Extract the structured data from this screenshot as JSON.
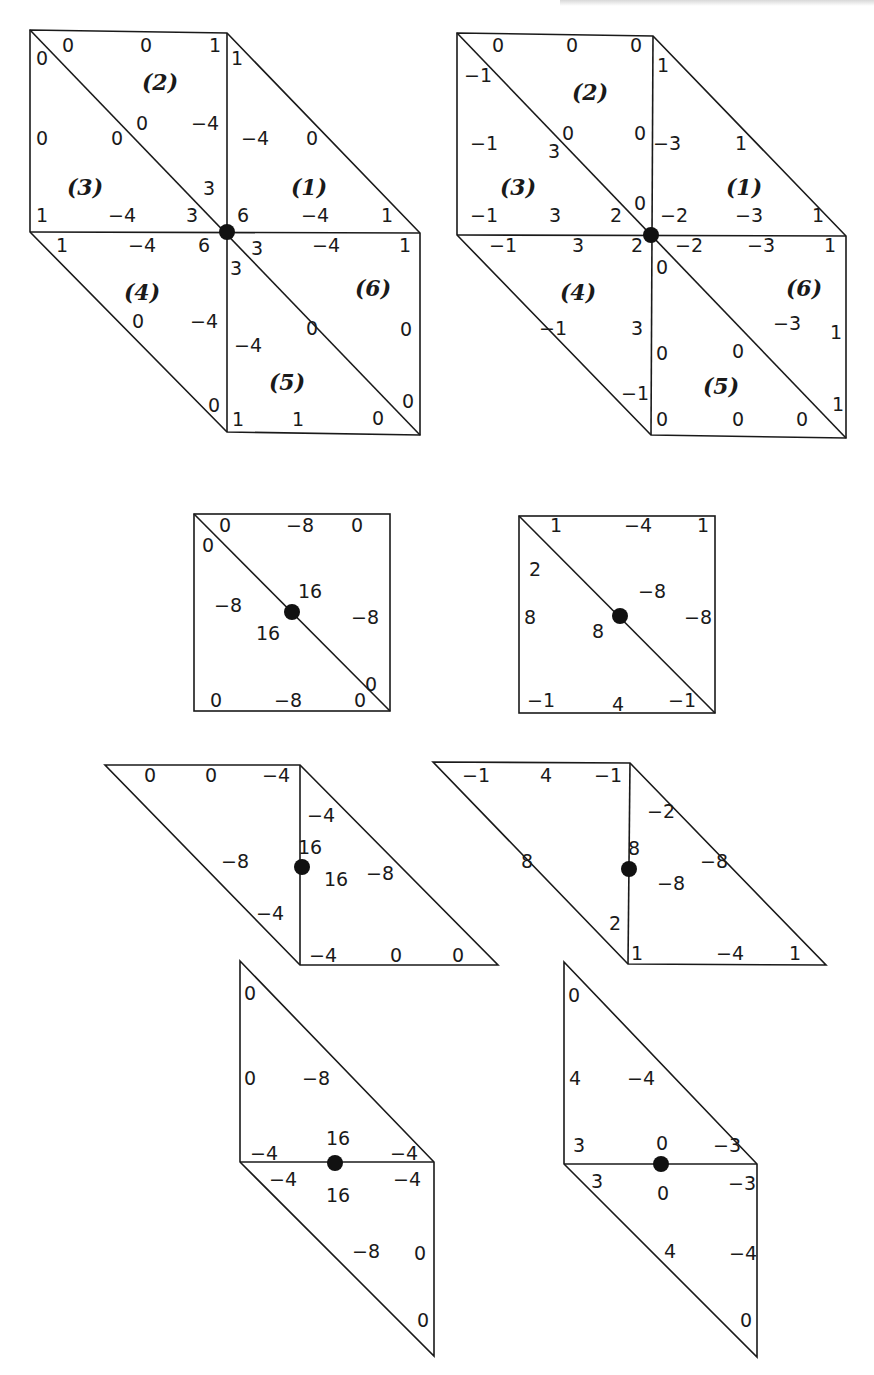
{
  "figure": {
    "panels": [
      {
        "id": "hex-left",
        "shape": "hexagon",
        "center_node": true,
        "regions": [
          "(1)",
          "(2)",
          "(3)",
          "(4)",
          "(5)",
          "(6)"
        ],
        "labels": [
          "0",
          "0",
          "1",
          "0",
          "1",
          "0",
          "0",
          "0",
          "-4",
          "-4",
          "0",
          "3",
          "1",
          "-4",
          "3",
          "6",
          "-4",
          "1",
          "1",
          "-4",
          "6",
          "3",
          "-4",
          "1",
          "3",
          "0",
          "-4",
          "-4",
          "0",
          "0",
          "0",
          "1",
          "1",
          "0",
          "0",
          "0"
        ]
      },
      {
        "id": "hex-right",
        "shape": "hexagon",
        "center_node": true,
        "regions": [
          "(1)",
          "(2)",
          "(3)",
          "(4)",
          "(5)",
          "(6)"
        ],
        "labels": [
          "0",
          "0",
          "0",
          "-1",
          "1",
          "-1",
          "3",
          "0",
          "0",
          "-3",
          "1",
          "0",
          "-1",
          "3",
          "2",
          "-2",
          "-3",
          "1",
          "-1",
          "3",
          "2",
          "-2",
          "-3",
          "1",
          "0",
          "-1",
          "3",
          "-3",
          "1",
          "0",
          "0",
          "-1",
          "0",
          "0",
          "0",
          "1"
        ]
      },
      {
        "id": "square-left",
        "shape": "square",
        "center_node": true,
        "labels": [
          "0",
          "-8",
          "0",
          "0",
          "16",
          "-8",
          "16",
          "-8",
          "0",
          "0",
          "-8",
          "0"
        ]
      },
      {
        "id": "square-right",
        "shape": "square",
        "center_node": true,
        "labels": [
          "1",
          "-4",
          "1",
          "2",
          "-8",
          "8",
          "8",
          "-8",
          "-1",
          "4",
          "-1"
        ]
      },
      {
        "id": "parallelogram-horizontal-left",
        "shape": "parallelogram",
        "center_node": true,
        "labels": [
          "0",
          "0",
          "-4",
          "-4",
          "16",
          "-8",
          "16",
          "-8",
          "-4",
          "-4",
          "0",
          "0"
        ]
      },
      {
        "id": "parallelogram-horizontal-right",
        "shape": "parallelogram",
        "center_node": true,
        "labels": [
          "-1",
          "4",
          "-1",
          "-2",
          "8",
          "8",
          "-8",
          "-8",
          "2",
          "1",
          "-4",
          "1"
        ]
      },
      {
        "id": "parallelogram-vertical-left",
        "shape": "parallelogram",
        "center_node": true,
        "labels": [
          "0",
          "0",
          "-8",
          "-4",
          "16",
          "-4",
          "-4",
          "16",
          "-4",
          "-8",
          "0",
          "0"
        ]
      },
      {
        "id": "parallelogram-vertical-right",
        "shape": "parallelogram",
        "center_node": true,
        "labels": [
          "0",
          "4",
          "-4",
          "3",
          "0",
          "-3",
          "3",
          "0",
          "-3",
          "4",
          "-4",
          "0"
        ]
      }
    ]
  }
}
